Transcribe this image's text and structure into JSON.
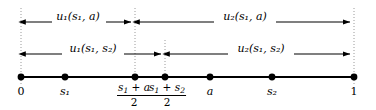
{
  "figure": {
    "width": 376,
    "height": 110,
    "colors": {
      "ink": "#000000",
      "background": "#ffffff",
      "guide": "#aaaaaa"
    }
  },
  "axis": {
    "start_x": 21,
    "end_x": 354,
    "y": 77,
    "points": [
      {
        "id": "zero",
        "x": 21,
        "label": "0",
        "italic": false
      },
      {
        "id": "s1",
        "x": 65,
        "label": "s",
        "sub": "1",
        "italic": true
      },
      {
        "id": "mid-s1-a",
        "x": 135,
        "label": "(s1 + a)/2",
        "italic": true
      },
      {
        "id": "mid-s1-s2",
        "x": 165,
        "label": "(s1 + s2)/2",
        "italic": true
      },
      {
        "id": "a",
        "x": 210,
        "label": "a",
        "italic": true
      },
      {
        "id": "s2",
        "x": 272,
        "label": "s",
        "sub": "2",
        "italic": true
      },
      {
        "id": "one",
        "x": 354,
        "label": "1",
        "italic": false
      }
    ]
  },
  "fractions": {
    "mid_s1_a": {
      "numerator_left": "s",
      "numerator_left_sub": "1",
      "operator": " + ",
      "numerator_right": "a",
      "denominator": "2"
    },
    "mid_s1_s2": {
      "numerator_left": "s",
      "numerator_left_sub": "1",
      "operator": " + ",
      "numerator_right": "s",
      "numerator_right_sub": "2",
      "denominator": "2"
    }
  },
  "rows": [
    {
      "id": "row-a",
      "y": 22,
      "split_x": 135,
      "segments": [
        {
          "id": "u1-s1-a",
          "label_base": "u",
          "label_sub": "1",
          "label_args": "(s1, a)",
          "from_x": 21,
          "to_x": 135,
          "center_x": 78
        },
        {
          "id": "u2-s1-a",
          "label_base": "u",
          "label_sub": "2",
          "label_args": "(s1, a)",
          "from_x": 135,
          "to_x": 354,
          "center_x": 245
        }
      ]
    },
    {
      "id": "row-s2",
      "y": 54,
      "split_x": 165,
      "segments": [
        {
          "id": "u1-s1-s2",
          "label_base": "u",
          "label_sub": "1",
          "label_args": "(s1, s2)",
          "from_x": 21,
          "to_x": 165,
          "center_x": 93
        },
        {
          "id": "u2-s1-s2",
          "label_base": "u",
          "label_sub": "2",
          "label_args": "(s1, s2)",
          "from_x": 165,
          "to_x": 354,
          "center_x": 260
        }
      ]
    }
  ],
  "guides": [
    {
      "id": "guide-zero",
      "x": 21,
      "from_y": 8,
      "to_y": 86
    },
    {
      "id": "guide-mid-s1-a",
      "x": 135,
      "from_y": 8,
      "to_y": 82
    },
    {
      "id": "guide-mid-s1-s2",
      "x": 165,
      "from_y": 40,
      "to_y": 82
    },
    {
      "id": "guide-one",
      "x": 354,
      "from_y": 8,
      "to_y": 86
    }
  ],
  "labels": {
    "u1_s1_a": "u₁(s₁, a)",
    "u2_s1_a": "u₂(s₁, a)",
    "u1_s1_s2": "u₁(s₁, s₂)",
    "u2_s1_s2": "u₂(s₁, s₂)",
    "tick_zero": "0",
    "tick_s1": "s₁",
    "tick_a": "a",
    "tick_s2": "s₂",
    "tick_one": "1"
  }
}
